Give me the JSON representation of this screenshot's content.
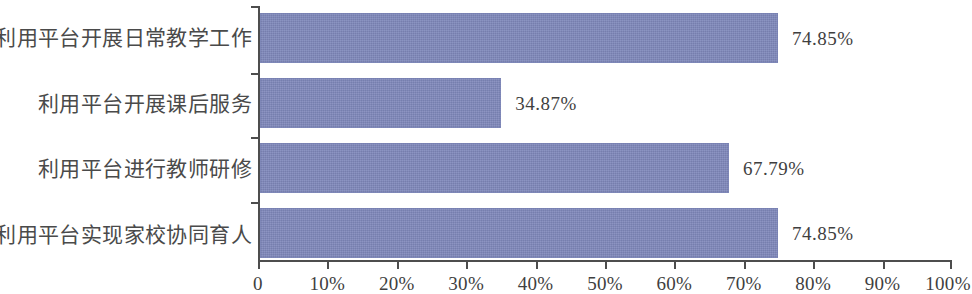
{
  "chart_data": {
    "type": "bar",
    "orientation": "horizontal",
    "title": "",
    "subtitle": "",
    "xlabel": "",
    "ylabel": "",
    "xlim": [
      0,
      100
    ],
    "grid": false,
    "legend": false,
    "legend_position": "none",
    "bar_color": "#7f88bb",
    "axis_color": "#4d4d4d",
    "text_color": "#3f3f3f",
    "categories": [
      "利用平台开展日常教学工作",
      "利用平台开展课后服务",
      "利用平台进行教师研修",
      "利用平台实现家校协同育人"
    ],
    "values": [
      74.85,
      34.87,
      67.79,
      74.85
    ],
    "value_labels": [
      "74.85%",
      "34.87%",
      "67.79%",
      "74.85%"
    ],
    "x_ticks": [
      0,
      10,
      20,
      30,
      40,
      50,
      60,
      70,
      80,
      90,
      100
    ],
    "x_tick_labels": [
      "0",
      "10%",
      "20%",
      "30%",
      "40%",
      "50%",
      "60%",
      "70%",
      "80%",
      "90%",
      "100%"
    ]
  }
}
